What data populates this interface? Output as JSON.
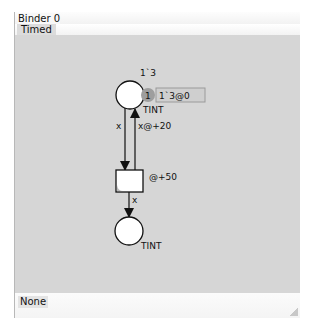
{
  "panel": {
    "title": "Binder 0",
    "tab_label": "Timed",
    "status": "None"
  },
  "net": {
    "top_place": {
      "initial_marking": "1`3",
      "token_count": "1",
      "current_marking": "1`3@0",
      "colset": "TINT"
    },
    "arc_place_to_transition": {
      "inscription": "x"
    },
    "arc_transition_to_place_back": {
      "inscription": "x@+20"
    },
    "transition": {
      "time_inscription": "@+50"
    },
    "arc_transition_to_bottom": {
      "inscription": "x"
    },
    "bottom_place": {
      "colset": "TINT"
    }
  },
  "colors": {
    "canvas": "#d6d6d6",
    "place_fill": "#ffffff",
    "stroke": "#111111",
    "token_badge": "#9e9e9e",
    "marking_box": "#cfcfcf"
  }
}
